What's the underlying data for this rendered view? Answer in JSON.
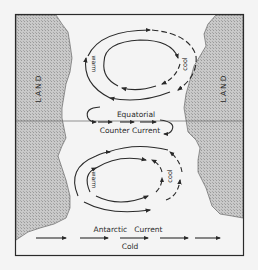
{
  "diagram": {
    "type": "ocean-current-circulation",
    "labels": {
      "land_left": "LAND",
      "land_right": "LAND",
      "north_gyre_west": "warm",
      "north_gyre_east": "cool",
      "south_gyre_west": "warm",
      "south_gyre_east": "cool",
      "equatorial_line1": "Equatorial",
      "equatorial_line2": "Counter Current",
      "antarctic_label": "Antarctic   Current",
      "cold_label": "Cold"
    },
    "colors": {
      "background": "#f4f4f4",
      "land_fill": "#bdbdbd",
      "stroke": "#2a2a2a"
    }
  }
}
